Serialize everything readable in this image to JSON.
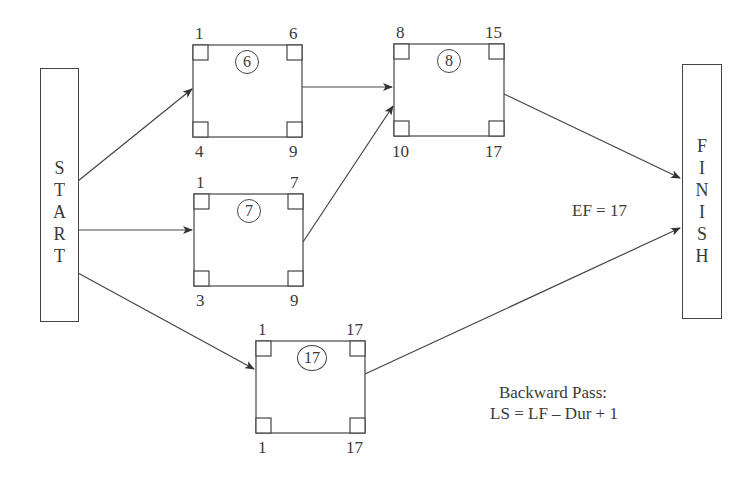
{
  "start_node": {
    "label": "START",
    "letters": [
      "S",
      "T",
      "A",
      "R",
      "T"
    ]
  },
  "finish_node": {
    "label": "FINISH",
    "letters": [
      "F",
      "I",
      "N",
      "I",
      "S",
      "H"
    ]
  },
  "activities": [
    {
      "id": "act6",
      "duration": "6",
      "es": "1",
      "ef": "6",
      "ls": "4",
      "lf": "9"
    },
    {
      "id": "act8",
      "duration": "8",
      "es": "8",
      "ef": "15",
      "ls": "10",
      "lf": "17"
    },
    {
      "id": "act7",
      "duration": "7",
      "es": "1",
      "ef": "7",
      "ls": "3",
      "lf": "9"
    },
    {
      "id": "act17",
      "duration": "17",
      "es": "1",
      "ef": "17",
      "ls": "1",
      "lf": "17"
    }
  ],
  "edges": [
    {
      "from": "START",
      "to": "act6"
    },
    {
      "from": "START",
      "to": "act7"
    },
    {
      "from": "START",
      "to": "act17"
    },
    {
      "from": "act6",
      "to": "act8"
    },
    {
      "from": "act7",
      "to": "act8"
    },
    {
      "from": "act8",
      "to": "FINISH"
    },
    {
      "from": "act17",
      "to": "FINISH"
    }
  ],
  "annotations": {
    "project_ef": "EF = 17",
    "backward_pass_title": "Backward Pass:",
    "backward_pass_formula": "LS = LF – Dur + 1"
  },
  "colors": {
    "line": "#444444",
    "text": "#3a3a3a",
    "background": "#ffffff"
  }
}
